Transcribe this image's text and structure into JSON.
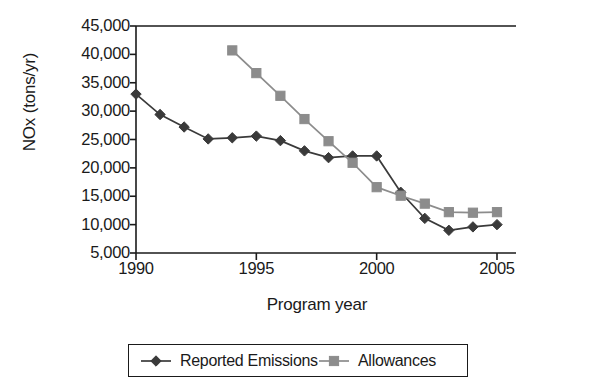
{
  "chart_data": {
    "type": "line",
    "title": "",
    "xlabel": "Program year",
    "ylabel": "NOx (tons/yr)",
    "x": [
      1990,
      1991,
      1992,
      1993,
      1994,
      1995,
      1996,
      1997,
      1998,
      1999,
      2000,
      2001,
      2002,
      2003,
      2004,
      2005
    ],
    "xlim": [
      1990,
      2005.8
    ],
    "ylim": [
      5000,
      45000
    ],
    "grid": false,
    "legend_position": "bottom",
    "xticks": [
      1990,
      1995,
      2000,
      2005
    ],
    "xtick_labels": [
      "1990",
      "1995",
      "2000",
      "2005"
    ],
    "yticks": [
      5000,
      10000,
      15000,
      20000,
      25000,
      30000,
      35000,
      40000,
      45000
    ],
    "ytick_labels": [
      "5,000",
      "10,000",
      "15,000",
      "20,000",
      "25,000",
      "30,000",
      "35,000",
      "40,000",
      "45,000"
    ],
    "series": [
      {
        "name": "Reported Emissions",
        "marker": "diamond",
        "color": "#3a3a3a",
        "x": [
          1990,
          1991,
          1992,
          1993,
          1994,
          1995,
          1996,
          1997,
          1998,
          1999,
          2000,
          2001,
          2002,
          2003,
          2004,
          2005
        ],
        "values": [
          33000,
          29400,
          27200,
          25100,
          25300,
          25600,
          24800,
          23000,
          21800,
          22100,
          22100,
          15700,
          11100,
          9000,
          9600,
          10000
        ]
      },
      {
        "name": "Allowances",
        "marker": "square",
        "color": "#8c8c8c",
        "x": [
          1994,
          1995,
          1996,
          1997,
          1998,
          1999,
          2000,
          2001,
          2002,
          2003,
          2004,
          2005
        ],
        "values": [
          40700,
          36700,
          32700,
          28600,
          24700,
          20900,
          16600,
          15100,
          13700,
          12200,
          12100,
          12200
        ]
      }
    ]
  },
  "legend": {
    "entries": [
      {
        "label": "Reported Emissions",
        "marker": "diamond",
        "color": "#3a3a3a"
      },
      {
        "label": "Allowances",
        "marker": "square",
        "color": "#8c8c8c"
      }
    ]
  },
  "colors": {
    "axis": "#1a1a1a",
    "emissions": "#3a3a3a",
    "allowances": "#8c8c8c",
    "background": "#ffffff"
  }
}
